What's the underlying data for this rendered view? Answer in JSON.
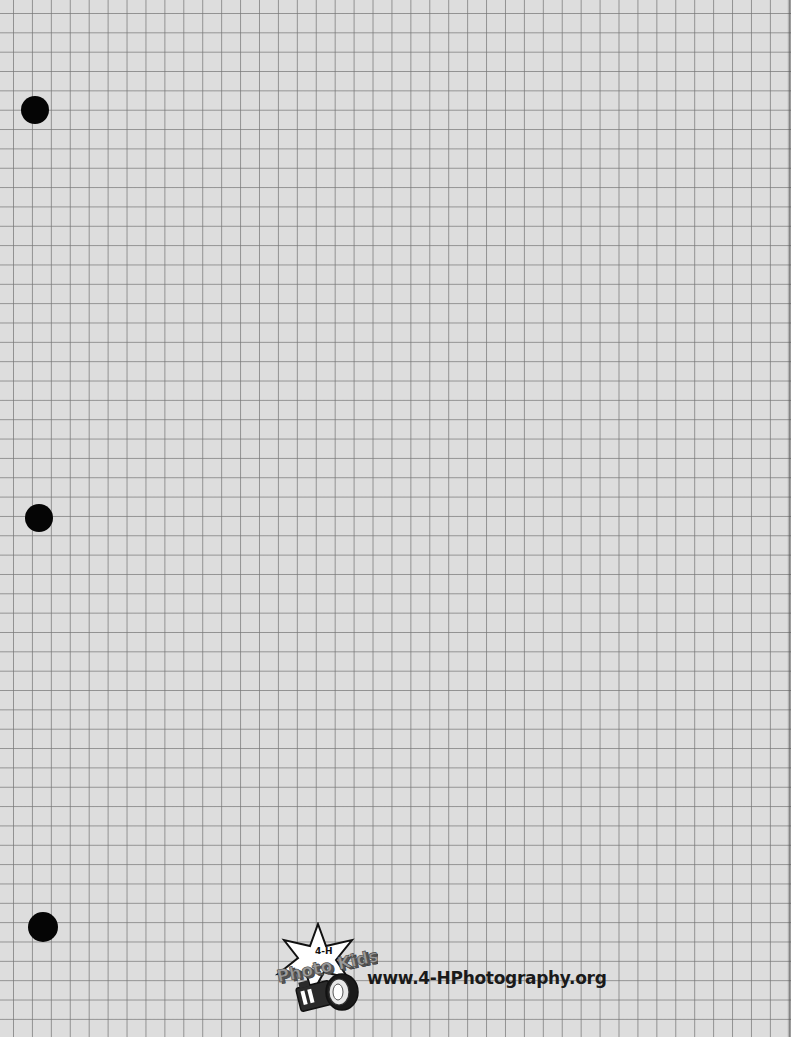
{
  "page": {
    "type": "graph-paper",
    "background_color": "#dddddd",
    "grid_line_color": "#787878",
    "grid_spacing_px": 19
  },
  "punch_holes": [
    {
      "name": "top",
      "cx": 35,
      "cy": 110,
      "r": 14
    },
    {
      "name": "middle",
      "cx": 39,
      "cy": 518,
      "r": 14
    },
    {
      "name": "bottom",
      "cx": 43,
      "cy": 927,
      "r": 15
    }
  ],
  "footer": {
    "logo": {
      "badge_text": "4-H",
      "title_text": "Photo Kids",
      "icon": "camera-icon",
      "shape": "star"
    },
    "url": "www.4-HPhotography.org"
  }
}
